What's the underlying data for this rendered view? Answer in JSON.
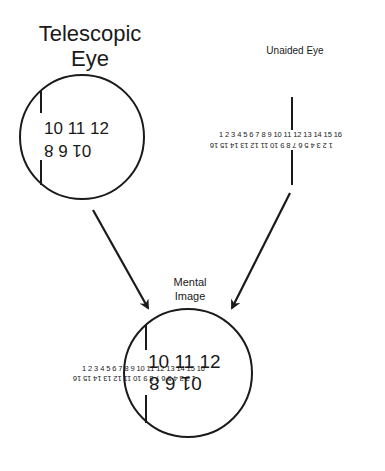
{
  "labels": {
    "telescopic_line1": "Telescopic",
    "telescopic_line2": "Eye",
    "unaided": "Unaided Eye",
    "mental_line1": "Mental",
    "mental_line2": "Image"
  },
  "telescopic_view": {
    "upright_row": "10 11 12",
    "inverted_row": "01 6 8"
  },
  "unaided_view": {
    "upright_row": "1 2 3 4 5 6 7 8 9 10 11 12 13 14 15 16",
    "inverted_row": "1 2 3 4 5 6 7 8 9 10 11 12 13 14 15 16"
  },
  "mental_view": {
    "large_upright": "10 11 12",
    "large_inverted": "01 6 8",
    "small_upright": "1 2 3 4 5 6 7 8 9 10 11 12 13 14 15 16",
    "small_inverted": "1 2 3 4 5 6 7 8 9 10 11 12 13 14 15 16"
  },
  "colors": {
    "ink": "#1a1a1a",
    "background": "#ffffff"
  }
}
